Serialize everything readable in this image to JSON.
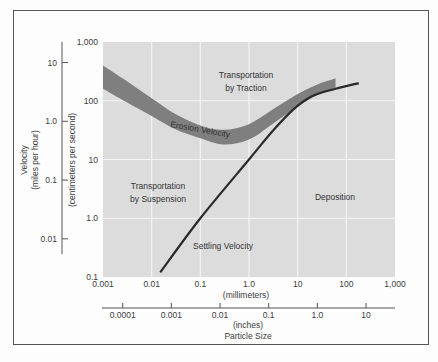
{
  "chart_data": {
    "type": "line",
    "title": "",
    "xlabel": "Particle Size",
    "x_axes": [
      {
        "name": "millimeters",
        "label": "(millimeters)",
        "scale": "log",
        "ticks": [
          "0.001",
          "0.01",
          "0.1",
          "1.0",
          "10",
          "100",
          "1,000"
        ],
        "range": [
          0.001,
          1000
        ]
      },
      {
        "name": "inches",
        "label": "(inches)",
        "scale": "log",
        "ticks": [
          "0.0001",
          "0.001",
          "0.01",
          "0.1",
          "1.0",
          "10"
        ]
      }
    ],
    "y_axes": [
      {
        "name": "cm_per_second",
        "label": "(centimeters per second)",
        "scale": "log",
        "ticks": [
          "0.1",
          "1.0",
          "10",
          "100",
          "1,000"
        ],
        "range": [
          0.1,
          1000
        ]
      },
      {
        "name": "miles_per_hour",
        "label": "Velocity\n(miles per hour)",
        "line1": "Velocity",
        "line2": "(miles per hour)",
        "scale": "log",
        "ticks": [
          "0.01",
          "0.1",
          "1.0",
          "10"
        ]
      }
    ],
    "grid": true,
    "series": [
      {
        "name": "Erosion Velocity",
        "kind": "band",
        "x_mm": [
          0.001,
          0.003,
          0.01,
          0.03,
          0.1,
          0.3,
          1.0,
          3.0,
          10,
          30,
          60
        ],
        "upper_cm_s": [
          400,
          220,
          110,
          60,
          38,
          32,
          40,
          70,
          130,
          200,
          240
        ],
        "lower_cm_s": [
          160,
          95,
          55,
          33,
          23,
          18,
          22,
          40,
          80,
          135,
          165
        ]
      },
      {
        "name": "Settling Velocity",
        "kind": "line",
        "x_mm": [
          0.015,
          0.1,
          1.0,
          3.0,
          8,
          20,
          60,
          180
        ],
        "y_cm_s": [
          0.12,
          1.0,
          10,
          30,
          70,
          120,
          160,
          200
        ]
      }
    ],
    "regions": [
      {
        "label_line1": "Transportation",
        "label_line2": "by Traction"
      },
      {
        "label_line1": "Transportation",
        "label_line2": "by Suspension"
      },
      {
        "label_line1": "Deposition"
      }
    ],
    "annotations": [
      "Erosion Velocity",
      "Settling Velocity"
    ]
  }
}
